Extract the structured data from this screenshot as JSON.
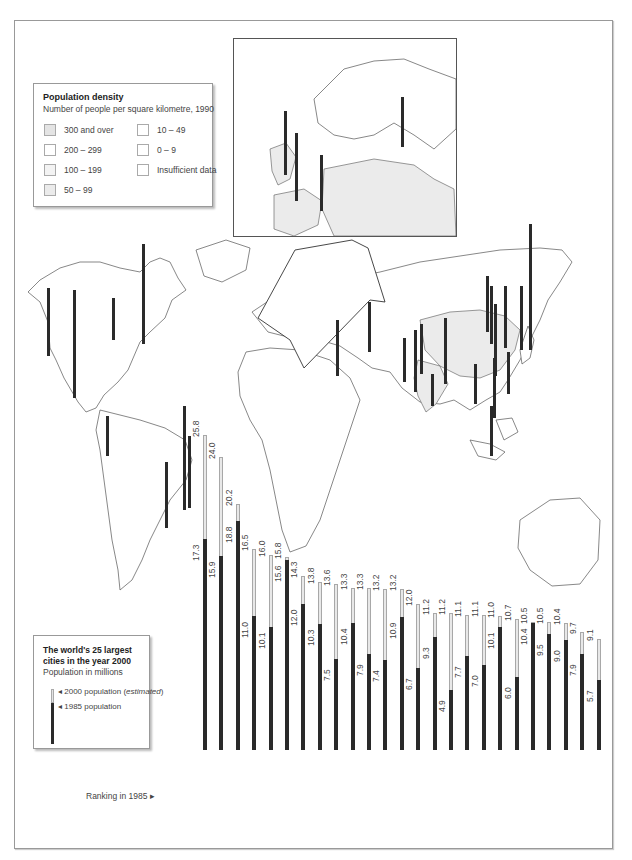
{
  "density_legend": {
    "title": "Population density",
    "subtitle": "Number of people per square kilometre, 1990",
    "items": [
      {
        "label": "300 and over",
        "color": "#e4e4e4"
      },
      {
        "label": "200 – 299",
        "color": "#ffffff"
      },
      {
        "label": "100 – 199",
        "color": "#f3f3f3"
      },
      {
        "label": "50 – 99",
        "color": "#ebebeb"
      },
      {
        "label": "10 – 49",
        "color": "#ffffff"
      },
      {
        "label": "0 – 9",
        "color": "#ffffff"
      },
      {
        "label": "Insufficient data",
        "color": "#ffffff"
      }
    ]
  },
  "cities_legend": {
    "title": "The world's 25 largest cities in the year 2000",
    "subtitle": "Population in millions",
    "key_2000": "2000 population (",
    "key_2000_em": "estimated",
    "key_2000_end": ")",
    "key_1985": "1985 population"
  },
  "ranking_label": "Ranking in 1985 ▸",
  "chart_data": {
    "type": "bar",
    "title": "The world's 25 largest cities in the year 2000",
    "subtitle": "Population in millions",
    "xlabel": "Ranking in 1985",
    "ylabel": "Population in millions",
    "ylim": [
      0,
      26
    ],
    "grid": false,
    "legend": [
      "2000 population (estimated)",
      "1985 population"
    ],
    "legend_position": "bottom-left",
    "categories": [
      "2. Mexico City",
      "3. Sao Paulo",
      "1. Tokyo",
      "6. Calcutta",
      "11. Bombay",
      "4. New York",
      "5. Shanghai",
      "10. Seoul",
      "20. Tehran",
      "8. Rio de Janeiro",
      "17. Jakarta",
      "21. Delhi",
      "7. Buenos Aires",
      "25. Karachi",
      "14. Beijing",
      "31. Dhaka",
      "19. Cairo",
      "23. Manila",
      "12. Los Angeles",
      "26. Bangkok",
      "9. London",
      "13. Osaka",
      "15. Moscow",
      "18. Tianjin",
      "27. Lima"
    ],
    "series": [
      {
        "name": "2000 population (estimated)",
        "values": [
          25.8,
          24.0,
          20.2,
          16.5,
          16.0,
          15.8,
          14.3,
          13.8,
          13.6,
          13.3,
          13.3,
          13.2,
          13.2,
          12.0,
          11.2,
          11.2,
          11.1,
          11.1,
          11.0,
          10.7,
          10.5,
          10.5,
          10.4,
          9.7,
          9.1
        ]
      },
      {
        "name": "1985 population",
        "values": [
          17.3,
          15.9,
          18.8,
          11.0,
          10.1,
          15.6,
          12.0,
          10.3,
          7.5,
          10.4,
          7.9,
          7.4,
          10.9,
          6.7,
          9.3,
          4.9,
          7.7,
          7.0,
          10.1,
          6.0,
          10.4,
          9.5,
          9.0,
          7.9,
          5.7
        ]
      }
    ]
  }
}
